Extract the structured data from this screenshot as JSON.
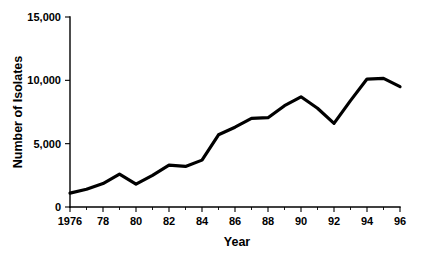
{
  "chart_data": {
    "type": "line",
    "title": "",
    "xlabel": "Year",
    "ylabel": "Number of Isolates",
    "xlim": [
      1976,
      1996
    ],
    "ylim": [
      0,
      15000
    ],
    "grid": false,
    "legend": null,
    "x": [
      1976,
      1977,
      1978,
      1979,
      1980,
      1981,
      1982,
      1983,
      1984,
      1985,
      1986,
      1987,
      1988,
      1989,
      1990,
      1991,
      1992,
      1993,
      1994,
      1995,
      1996
    ],
    "values": [
      1100,
      1400,
      1850,
      2600,
      1800,
      2500,
      3300,
      3200,
      3700,
      5700,
      6300,
      7000,
      7050,
      8000,
      8700,
      7800,
      6600,
      8400,
      10100,
      10150,
      9500
    ],
    "series": [
      {
        "name": "Number of Isolates",
        "values": [
          1100,
          1400,
          1850,
          2600,
          1800,
          2500,
          3300,
          3200,
          3700,
          5700,
          6300,
          7000,
          7050,
          8000,
          8700,
          7800,
          6600,
          8400,
          10100,
          10150,
          9500
        ]
      }
    ],
    "y_ticks": [
      0,
      5000,
      10000,
      15000
    ],
    "y_tick_labels": [
      "0",
      "5,000",
      "10,000",
      "15,000"
    ],
    "x_ticks": [
      1976,
      1978,
      1980,
      1982,
      1984,
      1986,
      1988,
      1990,
      1992,
      1994,
      1996
    ],
    "x_tick_labels": [
      "1976",
      "78",
      "80",
      "82",
      "84",
      "86",
      "88",
      "90",
      "92",
      "94",
      "96"
    ],
    "x_minor_ticks": [
      1977,
      1979,
      1981,
      1983,
      1985,
      1987,
      1989,
      1991,
      1993,
      1995
    ]
  }
}
